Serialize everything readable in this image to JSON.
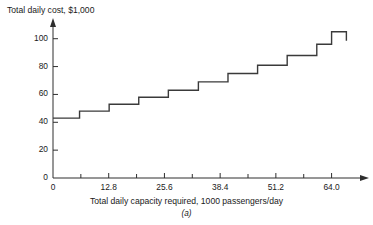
{
  "figure": {
    "clipped_header": "",
    "caption": "(a)"
  },
  "chart_data": {
    "type": "line",
    "style": "step",
    "title": "",
    "ylabel": "Total daily cost, $1,000",
    "xlabel": "Total daily capacity required, 1000 passengers/day",
    "xlim": [
      0,
      68.0
    ],
    "ylim": [
      0,
      112
    ],
    "grid": false,
    "legend": null,
    "axis_arrows": {
      "x": "right",
      "y": "up"
    },
    "yticks": [
      0,
      20,
      40,
      60,
      80,
      100
    ],
    "ytick_labels": [
      "0",
      "20",
      "40",
      "60",
      "80",
      "100"
    ],
    "xticks": [
      0,
      12.8,
      25.6,
      38.4,
      51.2,
      64.0
    ],
    "xtick_labels": [
      "0",
      "12.8",
      "25.6",
      "38.4",
      "51.2",
      "64.0"
    ],
    "x_minor_ticks": [
      6.4,
      19.2,
      32.0,
      44.8,
      57.6
    ],
    "steps": [
      {
        "x_start": 0.0,
        "x_end": 6.1,
        "y": 43
      },
      {
        "x_start": 6.1,
        "x_end": 12.9,
        "y": 48
      },
      {
        "x_start": 12.9,
        "x_end": 19.7,
        "y": 53
      },
      {
        "x_start": 19.7,
        "x_end": 26.5,
        "y": 58
      },
      {
        "x_start": 26.5,
        "x_end": 33.4,
        "y": 63
      },
      {
        "x_start": 33.4,
        "x_end": 40.2,
        "y": 69
      },
      {
        "x_start": 40.2,
        "x_end": 47.0,
        "y": 75
      },
      {
        "x_start": 47.0,
        "x_end": 53.8,
        "y": 81
      },
      {
        "x_start": 53.8,
        "x_end": 60.6,
        "y": 88
      },
      {
        "x_start": 60.6,
        "x_end": 64.0,
        "y": 96
      },
      {
        "x_start": 64.0,
        "x_end": 67.4,
        "y": 105
      }
    ],
    "series_color": "#3a3a3a"
  }
}
